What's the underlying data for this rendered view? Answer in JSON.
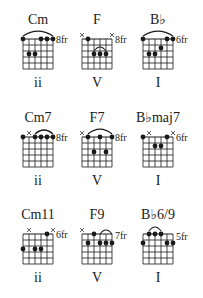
{
  "colors": {
    "ink": "#1a1a1a",
    "background": "#ffffff"
  },
  "chords": [
    {
      "name": "Cm",
      "numeral": "ii",
      "fret_label": "8fr",
      "frets": [
        1,
        3,
        3,
        1,
        1,
        1
      ],
      "muted": [],
      "arc": [
        1,
        6
      ]
    },
    {
      "name": "F",
      "numeral": "V",
      "fret_label": "8fr",
      "frets": [
        0,
        1,
        3,
        3,
        3,
        0
      ],
      "muted": [
        1,
        6
      ],
      "arc": [
        3,
        5
      ],
      "arc_small": true
    },
    {
      "name": "B♭",
      "numeral": "I",
      "fret_label": "6fr",
      "frets": [
        1,
        3,
        3,
        2,
        1,
        1
      ],
      "muted": [],
      "arc": [
        1,
        6
      ]
    },
    {
      "name": "Cm7",
      "numeral": "ii",
      "fret_label": "8fr",
      "frets": [
        1,
        0,
        1,
        1,
        1,
        1
      ],
      "muted": [
        2
      ],
      "arc": [
        3,
        6
      ]
    },
    {
      "name": "F7",
      "numeral": "V",
      "fret_label": "8fr",
      "frets": [
        0,
        1,
        3,
        1,
        3,
        1
      ],
      "muted": [
        1
      ],
      "arc": [
        2,
        6
      ]
    },
    {
      "name": "B♭maj7",
      "numeral": "I",
      "fret_label": "6fr",
      "frets": [
        1,
        0,
        2,
        2,
        1,
        0
      ],
      "muted": [
        2,
        6
      ],
      "arc": null
    },
    {
      "name": "Cm11",
      "numeral": "ii",
      "fret_label": "6fr",
      "frets": [
        3,
        0,
        3,
        3,
        1,
        0
      ],
      "muted": [
        2,
        6
      ],
      "arc": null
    },
    {
      "name": "F9",
      "numeral": "V",
      "fret_label": "7fr",
      "frets": [
        0,
        2,
        1,
        2,
        2,
        2
      ],
      "muted": [
        1
      ],
      "arc": [
        4,
        6
      ]
    },
    {
      "name": "B♭6/9",
      "numeral": "I",
      "fret_label": "5fr",
      "frets": [
        2,
        1,
        1,
        1,
        2,
        2
      ],
      "muted": [],
      "arc": [
        2,
        4
      ]
    }
  ]
}
